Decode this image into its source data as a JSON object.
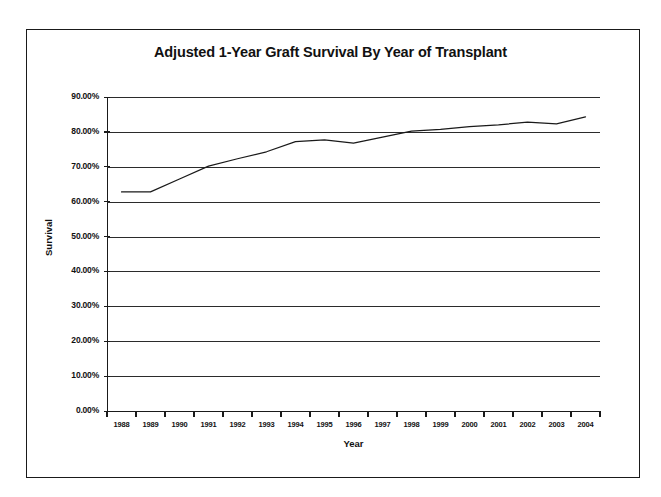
{
  "chart_data": {
    "type": "line",
    "title": "Adjusted 1-Year Graft Survival By Year of Transplant",
    "xlabel": "Year",
    "ylabel": "Survival",
    "grid": true,
    "legend": "none",
    "categories": [
      "1988",
      "1989",
      "1990",
      "1991",
      "1992",
      "1993",
      "1994",
      "1995",
      "1996",
      "1997",
      "1998",
      "1999",
      "2000",
      "2001",
      "2002",
      "2003",
      "2004"
    ],
    "x": [
      1988,
      1989,
      1990,
      1991,
      1992,
      1993,
      1994,
      1995,
      1996,
      1997,
      1998,
      1999,
      2000,
      2001,
      2002,
      2003,
      2004
    ],
    "ylim": [
      0,
      90
    ],
    "ytick_labels": [
      "90.00%",
      "80.00%",
      "70.00%",
      "60.00%",
      "50.00%",
      "40.00%",
      "30.00%",
      "20.00%",
      "10.00%",
      "0.00%"
    ],
    "ytick_values": [
      90,
      80,
      70,
      60,
      50,
      40,
      30,
      20,
      10,
      0
    ],
    "series": [
      {
        "name": "Adjusted 1-Year Graft Survival",
        "values": [
          62.8,
          62.8,
          66.5,
          70.2,
          72.3,
          74.3,
          77.2,
          77.7,
          76.8,
          78.5,
          80.2,
          80.7,
          81.5,
          82.0,
          82.8,
          82.3,
          84.3
        ],
        "color": "#1a1a1a"
      }
    ]
  },
  "figure": {
    "title": "Adjusted 1-Year Graft Survival By Year of Transplant",
    "xaxis_title": "Year",
    "yaxis_title": "Survival"
  }
}
